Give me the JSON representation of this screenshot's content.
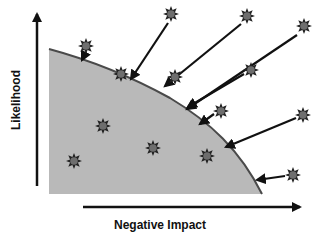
{
  "diagram": {
    "x_axis_label": "Negative Impact",
    "y_axis_label": "Likelihood",
    "colors": {
      "region_fill": "#b9b9b9",
      "curve_stroke": "#4a4a4a",
      "axis": "#111111",
      "star_fill": "#6e6e6e",
      "star_stroke": "#222222",
      "arrow": "#111111"
    },
    "region": {
      "description": "shaded acceptable-risk area under a downward curving boundary",
      "path_points": [
        [
          49,
          49
        ],
        [
          120,
          75
        ],
        [
          200,
          122
        ],
        [
          262,
          194
        ],
        [
          49,
          194
        ]
      ]
    },
    "stars": [
      {
        "id": "s1",
        "x": 86,
        "y": 46,
        "inside": false
      },
      {
        "id": "s2",
        "x": 121,
        "y": 74,
        "inside": "on-boundary"
      },
      {
        "id": "s3",
        "x": 175,
        "y": 77,
        "inside": false
      },
      {
        "id": "s4",
        "x": 221,
        "y": 111,
        "inside": false
      },
      {
        "id": "s5",
        "x": 103,
        "y": 126,
        "inside": true
      },
      {
        "id": "s6",
        "x": 153,
        "y": 148,
        "inside": true
      },
      {
        "id": "s7",
        "x": 207,
        "y": 156,
        "inside": true
      },
      {
        "id": "s8",
        "x": 74,
        "y": 161,
        "inside": true
      },
      {
        "id": "s9",
        "x": 171,
        "y": 14,
        "inside": false
      },
      {
        "id": "s10",
        "x": 247,
        "y": 16,
        "inside": false
      },
      {
        "id": "s11",
        "x": 304,
        "y": 26,
        "inside": false
      },
      {
        "id": "s12",
        "x": 251,
        "y": 70,
        "inside": false
      },
      {
        "id": "s13",
        "x": 303,
        "y": 115,
        "inside": false
      },
      {
        "id": "s14",
        "x": 293,
        "y": 175,
        "inside": false
      }
    ],
    "arrows": [
      {
        "from": "s1",
        "x1": 86,
        "y1": 52,
        "x2": 82,
        "y2": 60
      },
      {
        "from": "s9",
        "x1": 168,
        "y1": 23,
        "x2": 131,
        "y2": 79
      },
      {
        "from": "s10",
        "x1": 241,
        "y1": 24,
        "x2": 165,
        "y2": 86
      },
      {
        "from": "s11",
        "x1": 297,
        "y1": 35,
        "x2": 187,
        "y2": 109
      },
      {
        "from": "s12",
        "x1": 244,
        "y1": 74,
        "x2": 188,
        "y2": 107
      },
      {
        "from": "s4",
        "x1": 214,
        "y1": 114,
        "x2": 200,
        "y2": 124
      },
      {
        "from": "s13",
        "x1": 296,
        "y1": 118,
        "x2": 226,
        "y2": 147
      },
      {
        "from": "s14",
        "x1": 285,
        "y1": 176,
        "x2": 257,
        "y2": 180
      }
    ]
  }
}
